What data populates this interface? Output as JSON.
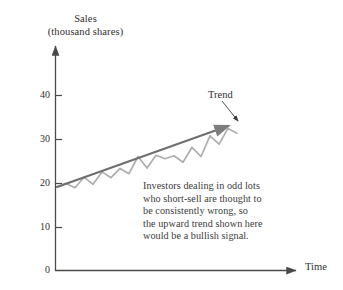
{
  "chart_data": {
    "type": "line",
    "title": "",
    "ylabel_lines": [
      "Sales",
      "(thousand shares)"
    ],
    "xlabel": "Time",
    "ylim": [
      0,
      45
    ],
    "yticks": [
      0,
      10,
      20,
      30,
      40
    ],
    "ytick_labels": [
      "0",
      "10",
      "20",
      "30",
      "40"
    ],
    "xticks": [],
    "xtick_labels": [],
    "grid": false,
    "legend": "none",
    "axes_style": "arrow-tipped open axes",
    "series": [
      {
        "name": "Sales",
        "style": "zigzag line, light gray",
        "color": "#aeaeae",
        "x": [
          0,
          1,
          2,
          3,
          4,
          5,
          6,
          7,
          8,
          9,
          10,
          11,
          12,
          13,
          14,
          15,
          16,
          17,
          18,
          19,
          20
        ],
        "values": [
          19.0,
          19.8,
          18.8,
          21.2,
          19.6,
          22.4,
          21.1,
          23.2,
          22.0,
          25.9,
          23.3,
          26.2,
          25.4,
          26.1,
          24.6,
          28.0,
          25.9,
          30.6,
          28.7,
          32.3,
          31.2
        ]
      },
      {
        "name": "Trend",
        "style": "straight fitted line with arrowhead, dark gray",
        "color": "#6f6f6f",
        "x": [
          0,
          20
        ],
        "values": [
          19.0,
          33.5
        ]
      }
    ],
    "annotations": [
      {
        "name": "trend-callout",
        "text": "Trend",
        "points_to": "end of trend line"
      },
      {
        "name": "note",
        "lines": [
          "Investors dealing in odd lots",
          "who short-sell are thought to",
          "be consistently wrong, so",
          "the upward trend shown here",
          "would be a bullish signal."
        ]
      }
    ],
    "colors": {
      "background": "#ffffff",
      "axis": "#4a4a4a",
      "text": "#2f2f2f",
      "series": "#aeaeae",
      "trend": "#6f6f6f"
    }
  }
}
